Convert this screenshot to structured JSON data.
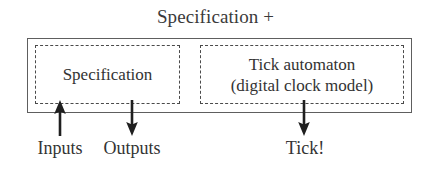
{
  "figure": {
    "title": "Specification +",
    "outer_box": {
      "name": "specification-plus-container",
      "border_color": "#5e5e5e",
      "border_style": "solid"
    },
    "components": [
      {
        "id": "specification",
        "label": "Specification",
        "border_style": "dashed",
        "border_color": "#4a4a4a"
      },
      {
        "id": "tick-automaton",
        "label_line1": "Tick automaton",
        "label_line2": "(digital clock model)",
        "border_style": "dashed",
        "border_color": "#4a4a4a"
      }
    ],
    "ports": [
      {
        "id": "inputs",
        "label": "Inputs",
        "direction": "in",
        "arrow": "arrow-up-icon"
      },
      {
        "id": "outputs",
        "label": "Outputs",
        "direction": "out",
        "arrow": "arrow-down-icon"
      },
      {
        "id": "tick",
        "label": "Tick!",
        "direction": "out",
        "arrow": "arrow-down-icon"
      }
    ],
    "colors": {
      "background": "#ffffff",
      "ink": "#333333",
      "rule": "#5e5e5e"
    }
  }
}
